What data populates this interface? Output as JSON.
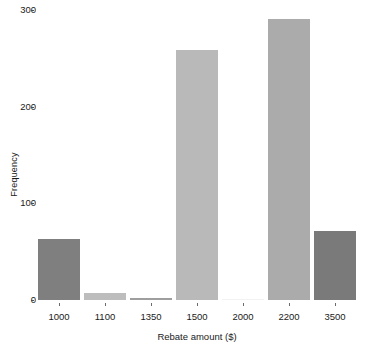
{
  "chart_data": {
    "type": "bar",
    "title": "",
    "xlabel": "Rebate amount ($)",
    "ylabel": "Frequency",
    "categories": [
      "1000",
      "1100",
      "1350",
      "1500",
      "2000",
      "2200",
      "3500"
    ],
    "values": [
      63,
      7,
      2,
      259,
      0,
      291,
      71
    ],
    "bar_colors": [
      "#7f7f7f",
      "#bdbdbd",
      "#9e9e9e",
      "#b9b9b9",
      "#f2f2f2",
      "#ababab",
      "#7a7a7a"
    ],
    "ylim": [
      0,
      300
    ],
    "yticks": [
      0,
      100,
      200,
      300
    ],
    "ytick_labels": [
      "0",
      "100",
      "200",
      "300"
    ],
    "grid": false,
    "legend": false,
    "background": "#ffffff"
  },
  "axes": {
    "y_title": "Frequency",
    "x_title": "Rebate amount ($)"
  }
}
